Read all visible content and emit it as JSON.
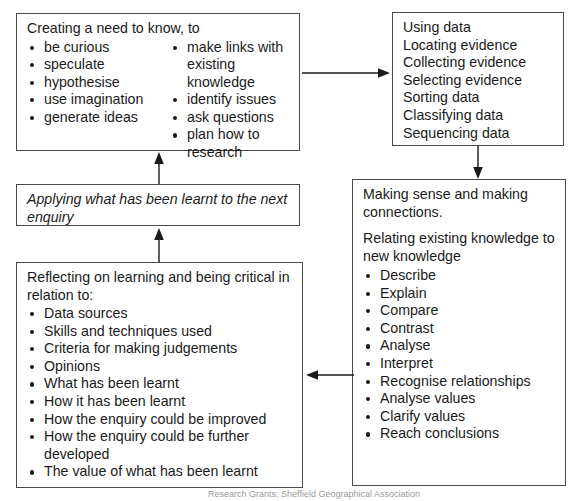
{
  "diagram": {
    "boxes": {
      "creating": {
        "heading": "Creating a need to know, to",
        "column_left": [
          "be curious",
          "speculate",
          "hypothesise",
          "use imagination",
          "generate ideas"
        ],
        "column_right": [
          "make links with existing knowledge",
          "identify issues",
          "ask questions",
          "plan how to research"
        ]
      },
      "using": {
        "lines": [
          "Using data",
          "Locating evidence",
          "Collecting evidence",
          "Selecting evidence",
          "Sorting data",
          "Classifying data",
          "Sequencing data"
        ]
      },
      "making": {
        "heading": "Making sense and making connections.",
        "subheading": "Relating existing knowledge to new knowledge",
        "items": [
          "Describe",
          "Explain",
          "Compare",
          "Contrast",
          "Analyse",
          "Interpret",
          "Recognise relationships",
          "Analyse values",
          "Clarify values",
          "Reach conclusions"
        ]
      },
      "reflecting": {
        "heading": "Reflecting on learning and being critical in relation to:",
        "items": [
          "Data sources",
          "Skills and techniques used",
          "Criteria for making judgements",
          "Opinions",
          "What has been learnt",
          "How it has been learnt",
          "How the enquiry could be improved",
          "How the enquiry could be further developed",
          "The value of what has been learnt"
        ]
      },
      "applying": {
        "heading": "Applying what has been learnt to the next enquiry"
      }
    },
    "arrows": [
      {
        "name": "creating-to-using",
        "direction": "right"
      },
      {
        "name": "using-to-making",
        "direction": "down"
      },
      {
        "name": "making-to-reflecting",
        "direction": "left"
      },
      {
        "name": "reflecting-to-applying",
        "direction": "up"
      },
      {
        "name": "applying-to-creating",
        "direction": "up"
      }
    ],
    "caption": "Research Grants, Sheffield Geographical Association",
    "colors": {
      "ink": "#1a1a1a",
      "border": "#4a4a4a",
      "background": "#ffffff",
      "caption": "#9a9a9a"
    }
  }
}
